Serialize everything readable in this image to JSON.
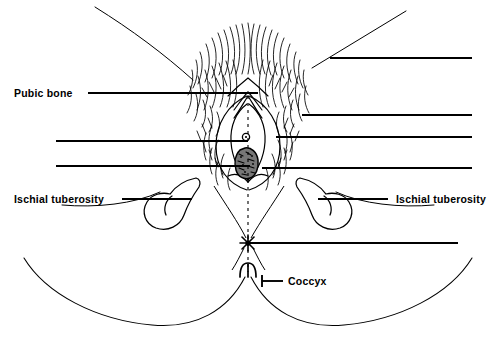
{
  "figure": {
    "type": "anatomical-line-drawing",
    "width": 495,
    "height": 345,
    "background_color": "#ffffff",
    "ink_color": "#000000",
    "labels": [
      {
        "id": "pubic-bone",
        "text": "Pubic bone",
        "side": "left",
        "text_x": 14,
        "text_y": 88,
        "leader": {
          "x1": 88,
          "y1": 93,
          "x2": 258,
          "y2": 93
        }
      },
      {
        "id": "ischial-tuberosity-left",
        "text": "Ischial tuberosity",
        "side": "left",
        "text_x": 14,
        "text_y": 194,
        "leader": {
          "x1": 122,
          "y1": 199,
          "x2": 192,
          "y2": 199
        }
      },
      {
        "id": "ischial-tuberosity-right",
        "text": "Ischial tuberosity",
        "side": "right",
        "text_x": 396,
        "text_y": 194,
        "leader": {
          "x1": 388,
          "y1": 199,
          "x2": 318,
          "y2": 199
        }
      },
      {
        "id": "coccyx",
        "text": "Coccyx",
        "side": "right",
        "text_x": 288,
        "text_y": 276,
        "leader": {
          "x1": 283,
          "y1": 281,
          "x2": 258,
          "y2": 281
        }
      }
    ],
    "unlabeled_leaders": [
      {
        "id": "leader-left-upper",
        "x1": 56,
        "y1": 141,
        "x2": 248,
        "y2": 141
      },
      {
        "id": "leader-left-lower",
        "x1": 56,
        "y1": 166,
        "x2": 250,
        "y2": 166
      },
      {
        "id": "leader-right-upper",
        "x1": 302,
        "y1": 115,
        "x2": 472,
        "y2": 115
      },
      {
        "id": "leader-right-middle",
        "x1": 276,
        "y1": 137,
        "x2": 472,
        "y2": 137
      },
      {
        "id": "leader-right-lower",
        "x1": 262,
        "y1": 168,
        "x2": 472,
        "y2": 168
      },
      {
        "id": "leader-perineum-right",
        "x1": 250,
        "y1": 243,
        "x2": 458,
        "y2": 243
      },
      {
        "id": "leader-top-label",
        "x1": 330,
        "y1": 58,
        "x2": 472,
        "y2": 58
      }
    ],
    "pointer_lines": [
      {
        "id": "pointer-top-left",
        "x1": 95,
        "y1": 7,
        "x2": 193,
        "y2": 80
      },
      {
        "id": "pointer-top-right",
        "x1": 406,
        "y1": 11,
        "x2": 312,
        "y2": 68
      }
    ],
    "markers": [
      {
        "id": "perineum-star",
        "shape": "starburst",
        "x": 248,
        "y": 243,
        "radius": 8
      }
    ],
    "midline": {
      "id": "midline-dashed",
      "x": 248,
      "y1": 96,
      "y2": 272,
      "style": "dashed"
    },
    "structures": [
      {
        "id": "pubic-hair-region",
        "description": "Dense stippled hair strokes over mons pubis"
      },
      {
        "id": "labia-outline",
        "description": "Vulvar outline with labia majora and minora"
      },
      {
        "id": "urethral-opening",
        "description": "Small circular urethral meatus",
        "x": 246,
        "y": 137
      },
      {
        "id": "vaginal-opening",
        "description": "Textured oval vaginal introitus",
        "x": 248,
        "y": 163
      },
      {
        "id": "ischial-tuberosity-left-bulb",
        "description": "Rounded hook-shaped bony prominence, left"
      },
      {
        "id": "ischial-tuberosity-right-bulb",
        "description": "Rounded hook-shaped bony prominence, right"
      },
      {
        "id": "coccyx-tip",
        "description": "Small dome at base of midline"
      },
      {
        "id": "buttock-curve-left",
        "description": "Large sweeping outer contour, left"
      },
      {
        "id": "buttock-curve-right",
        "description": "Large sweeping outer contour, right"
      },
      {
        "id": "thigh-outline-left",
        "description": "Inner thigh contour, left"
      },
      {
        "id": "thigh-outline-right",
        "description": "Inner thigh contour, right"
      }
    ]
  }
}
